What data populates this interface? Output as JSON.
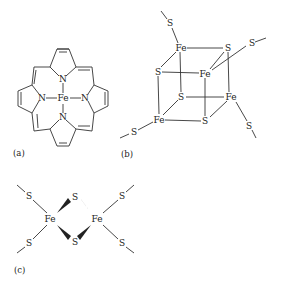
{
  "figure": {
    "panels": [
      {
        "id": "a",
        "caption": "(a)",
        "description": "Iron porphyrin (heme-like) complex",
        "atoms": {
          "center": "Fe",
          "n_top": "N",
          "n_left": "N",
          "n_right": "N",
          "n_bottom": "N"
        }
      },
      {
        "id": "b",
        "caption": "(b)",
        "description": "Fe4S4 cubane cluster with four terminal thiolate ligands",
        "atoms": {
          "s_term_1": "S",
          "fe1": "Fe",
          "s1": "S",
          "s_term_2": "S",
          "s2": "S",
          "fe2": "Fe",
          "s3": "S",
          "fe3": "Fe",
          "fe4": "Fe",
          "s4": "S",
          "s_term_3": "S",
          "s_term_4": "S"
        }
      },
      {
        "id": "c",
        "caption": "(c)",
        "description": "Fe2S2 cluster with four terminal thiolate ligands",
        "atoms": {
          "fe_left": "Fe",
          "fe_right": "Fe",
          "s_bridge_top": "S",
          "s_bridge_bottom": "S",
          "s_ul": "S",
          "s_ll": "S",
          "s_ur": "S",
          "s_lr": "S"
        }
      }
    ],
    "colors": {
      "ink": "#333333",
      "background": "#ffffff"
    }
  }
}
